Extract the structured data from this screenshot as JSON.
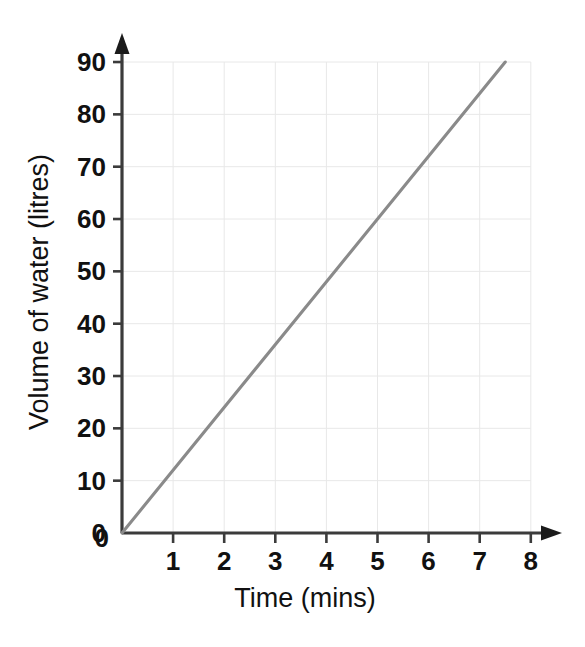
{
  "chart_data": {
    "type": "line",
    "title": "",
    "subtitle": "",
    "xlabel": "Time (mins)",
    "ylabel": "Volume of water (litres)",
    "xlim": [
      0,
      8
    ],
    "ylim": [
      0,
      90
    ],
    "xticks": [
      0,
      1,
      2,
      3,
      4,
      5,
      6,
      7,
      8
    ],
    "yticks": [
      0,
      10,
      20,
      30,
      40,
      50,
      60,
      70,
      80,
      90
    ],
    "xtick_labels": [
      "0",
      "1",
      "2",
      "3",
      "4",
      "5",
      "6",
      "7",
      "8"
    ],
    "ytick_labels": [
      "0",
      "10",
      "20",
      "30",
      "40",
      "50",
      "60",
      "70",
      "80",
      "90"
    ],
    "grid": true,
    "grid_color": "#e8e8e8",
    "legend": null,
    "legend_position": "none",
    "annotations": [],
    "series": [
      {
        "name": "Volume of water",
        "color": "#8a8a8a",
        "x": [
          0,
          7.5
        ],
        "y": [
          0,
          90
        ],
        "points": [
          {
            "x": 0,
            "y": 0
          },
          {
            "x": 1,
            "y": 12
          },
          {
            "x": 2,
            "y": 24
          },
          {
            "x": 3,
            "y": 36
          },
          {
            "x": 4,
            "y": 48
          },
          {
            "x": 5,
            "y": 60
          },
          {
            "x": 6,
            "y": 72
          },
          {
            "x": 7,
            "y": 84
          },
          {
            "x": 7.5,
            "y": 90
          }
        ],
        "slope": 12,
        "intercept": 0
      }
    ]
  },
  "axes": {
    "x_title": "Time (mins)",
    "y_title": "Volume of water (litres)",
    "x_arrow": "arrow-right",
    "y_arrow": "arrow-up"
  },
  "colors": {
    "line": "#8a8a8a",
    "axis": "#3b3b3b",
    "grid": "#e8e8e8",
    "text": "#111111",
    "background": "#ffffff"
  }
}
